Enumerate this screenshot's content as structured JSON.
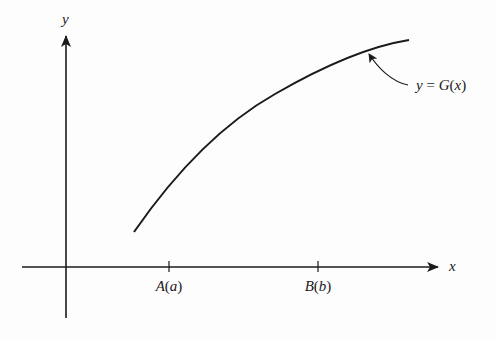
{
  "figure": {
    "type": "function-graph",
    "axes": {
      "x_label": "x",
      "y_label": "y"
    },
    "ticks": [
      {
        "id": "A",
        "label_point": "A",
        "label_param": "a",
        "label": "A(a)"
      },
      {
        "id": "B",
        "label_point": "B",
        "label_param": "b",
        "label": "B(b)"
      }
    ],
    "curve": {
      "name": "G",
      "annotation": "y = G(x)",
      "annotation_parts": {
        "lhs": "y",
        "eq": " = ",
        "func": "G",
        "open": "(",
        "arg": "x",
        "close": ")"
      },
      "shape": "increasing, concave down"
    },
    "colors": {
      "ink": "#1a1a1a",
      "background": "#fdfdfd"
    }
  }
}
